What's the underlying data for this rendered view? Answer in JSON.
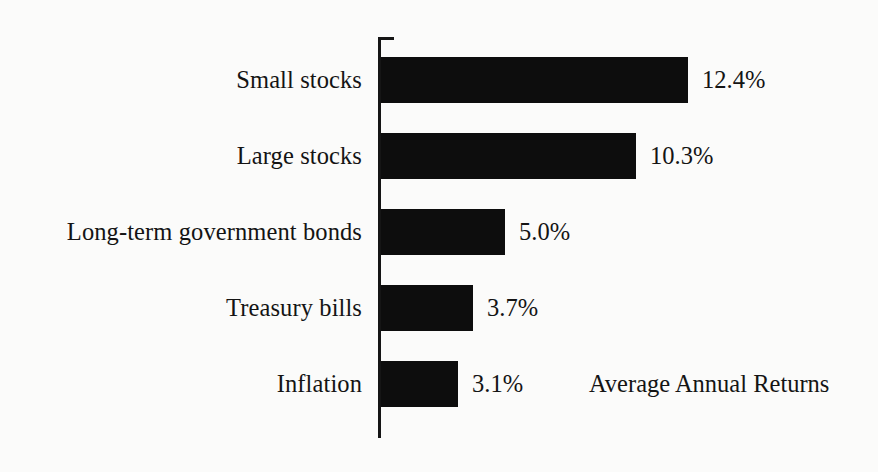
{
  "chart_data": {
    "type": "bar",
    "orientation": "horizontal",
    "title": "",
    "subtitle": "",
    "xlabel": "",
    "ylabel": "",
    "categories": [
      "Small stocks",
      "Large stocks",
      "Long-term government bonds",
      "Treasury bills",
      "Inflation"
    ],
    "values": [
      12.4,
      10.3,
      5.0,
      3.7,
      3.1
    ],
    "value_labels": [
      "12.4%",
      "10.3%",
      "5.0%",
      "3.7%",
      "3.1%"
    ],
    "units": "percent",
    "xlim": [
      0,
      12.4
    ],
    "grid": false,
    "legend": false,
    "legend_position": "none",
    "annotations": [
      {
        "text": "Average Annual Returns",
        "attached_to_category": "Inflation"
      }
    ],
    "colors": {
      "bar": "#0d0d0d",
      "axis": "#151515",
      "text": "#141414",
      "background": "#fbfbfa"
    }
  }
}
